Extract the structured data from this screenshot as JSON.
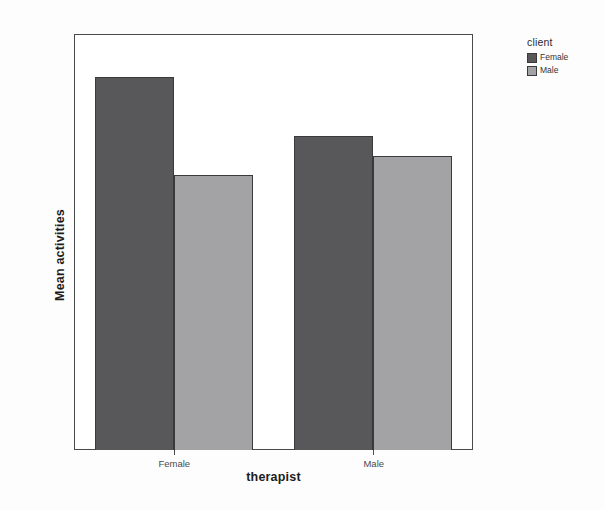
{
  "chart_data": {
    "type": "bar",
    "title": "",
    "subtitle": "",
    "xlabel": "therapist",
    "ylabel": "Mean activities",
    "categories": [
      "Female",
      "Male"
    ],
    "series": [
      {
        "name": "Female",
        "values": [
          19,
          16
        ],
        "color": "#58585a"
      },
      {
        "name": "Male",
        "values": [
          14,
          15
        ],
        "color": "#a3a3a5"
      }
    ],
    "legend": {
      "title": "client",
      "position": "right",
      "entries": [
        "Female",
        "Male"
      ]
    },
    "ylim": [
      0,
      21.2
    ],
    "yticks": [
      0,
      5,
      10,
      15,
      20
    ],
    "ytick_labels": [
      "0",
      "5",
      "10",
      "15",
      "20"
    ],
    "xtick_labels": [
      "Female",
      "Male"
    ],
    "grid": false,
    "frame": true,
    "bar_grouping": "grouped",
    "background_color": "#fdfdfd",
    "plot_background_color": "#ffffff",
    "axis_color": "#4a4a4a"
  }
}
